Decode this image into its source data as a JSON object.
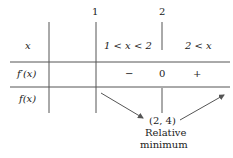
{
  "table": {
    "critical_points": [
      "1",
      "2"
    ],
    "row_labels": {
      "x": "x",
      "fprime": "f′(x)",
      "f": "f(x)"
    },
    "intervals": [
      "1 < x < 2",
      "2 < x"
    ],
    "fprime_values": {
      "interval1": "−",
      "at2": "0",
      "interval2": "+"
    },
    "annotation": {
      "point": "(2, 4)",
      "line1": "Relative",
      "line2": "minimum"
    }
  }
}
